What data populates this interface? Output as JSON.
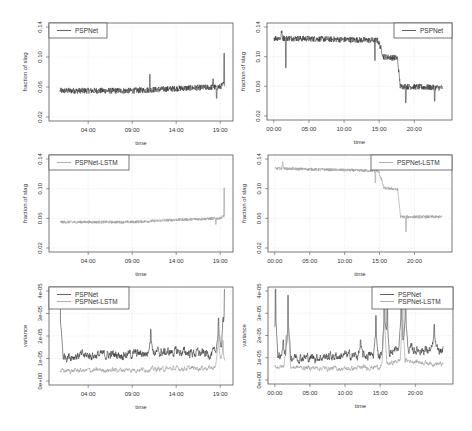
{
  "colors": {
    "pspnet": "#3a3a3a",
    "lstm": "#9a9a9a",
    "grid": "#d8d8d8",
    "frame": "#555555"
  },
  "chart_data": [
    {
      "type": "line",
      "id": "p1",
      "xlabel": "time",
      "ylabel": "fraction of slag",
      "ylim": [
        0.02,
        0.14
      ],
      "yticks": [
        "0.02",
        "0.06",
        "0.10",
        "0.14"
      ],
      "ytick_values": [
        0.02,
        0.06,
        0.1,
        0.14
      ],
      "xlim": [
        0,
        20
      ],
      "xticks": [
        "04:00",
        "09:00",
        "14:00",
        "19:00"
      ],
      "xtick_values": [
        4,
        9,
        14,
        19
      ],
      "legend": {
        "position": "top-left",
        "entries": [
          {
            "name": "PSPNet",
            "color": "pspnet"
          }
        ]
      },
      "series": [
        {
          "name": "PSPNet",
          "color": "pspnet",
          "x_range": [
            0.8,
            19.5
          ],
          "noise": 0.004,
          "levels": [
            [
              0.8,
              0.055
            ],
            [
              9,
              0.055
            ],
            [
              14,
              0.058
            ],
            [
              19,
              0.06
            ],
            [
              19.5,
              0.065
            ]
          ],
          "spikes": [
            [
              11,
              0.077
            ],
            [
              18.2,
              0.071
            ],
            [
              18.6,
              0.045
            ],
            [
              19.45,
              0.105
            ]
          ]
        }
      ]
    },
    {
      "type": "line",
      "id": "p2",
      "xlabel": "time",
      "ylabel": "fraction of slag",
      "ylim": [
        0.02,
        0.14
      ],
      "yticks": [
        "0.02",
        "0.06",
        "0.10",
        "0.14"
      ],
      "ytick_values": [
        0.02,
        0.06,
        0.1,
        0.14
      ],
      "xlim": [
        -0.4,
        24.8
      ],
      "xticks": [
        "00:00",
        "05:00",
        "10:00",
        "15:00",
        "20:00"
      ],
      "xtick_values": [
        0,
        5,
        10,
        15,
        20
      ],
      "legend": {
        "position": "top-right",
        "entries": [
          {
            "name": "PSPNet",
            "color": "pspnet"
          }
        ]
      },
      "series": [
        {
          "name": "PSPNet",
          "color": "pspnet",
          "x_range": [
            0,
            24
          ],
          "noise": 0.004,
          "levels": [
            [
              0,
              0.125
            ],
            [
              1,
              0.125
            ],
            [
              1.1,
              0.135
            ],
            [
              1.3,
              0.125
            ],
            [
              14.8,
              0.122
            ],
            [
              15.3,
              0.11
            ],
            [
              15.6,
              0.1
            ],
            [
              17.6,
              0.098
            ],
            [
              18.0,
              0.06
            ],
            [
              24,
              0.058
            ]
          ],
          "spikes": [
            [
              1.7,
              0.085
            ],
            [
              14.4,
              0.095
            ],
            [
              18.8,
              0.038
            ],
            [
              22.9,
              0.04
            ]
          ]
        }
      ]
    },
    {
      "type": "line",
      "id": "p3",
      "xlabel": "time",
      "ylabel": "fraction of slag",
      "ylim": [
        0.02,
        0.14
      ],
      "yticks": [
        "0.02",
        "0.06",
        "0.10",
        "0.14"
      ],
      "ytick_values": [
        0.02,
        0.06,
        0.1,
        0.14
      ],
      "xlim": [
        0,
        20
      ],
      "xticks": [
        "04:00",
        "09:00",
        "14:00",
        "19:00"
      ],
      "xtick_values": [
        4,
        9,
        14,
        19
      ],
      "legend": {
        "position": "top-left",
        "entries": [
          {
            "name": "PSPNet-LSTM",
            "color": "lstm"
          }
        ]
      },
      "series": [
        {
          "name": "PSPNet-LSTM",
          "color": "lstm",
          "x_range": [
            0.8,
            19.5
          ],
          "noise": 0.002,
          "levels": [
            [
              0.8,
              0.055
            ],
            [
              9,
              0.055
            ],
            [
              14,
              0.058
            ],
            [
              19,
              0.06
            ],
            [
              19.5,
              0.064
            ]
          ],
          "spikes": [
            [
              19.45,
              0.101
            ],
            [
              18.5,
              0.052
            ]
          ]
        }
      ]
    },
    {
      "type": "line",
      "id": "p4",
      "xlabel": "time",
      "ylabel": "fraction of slag",
      "ylim": [
        0.02,
        0.14
      ],
      "yticks": [
        "0.02",
        "0.06",
        "0.10",
        "0.14"
      ],
      "ytick_values": [
        0.02,
        0.06,
        0.1,
        0.14
      ],
      "xlim": [
        -0.4,
        24.8
      ],
      "xticks": [
        "00:00",
        "05:00",
        "10:00",
        "15:00",
        "20:00"
      ],
      "xtick_values": [
        0,
        5,
        10,
        15,
        20
      ],
      "legend": {
        "position": "top-right",
        "entries": [
          {
            "name": "PSPNet-LSTM",
            "color": "lstm"
          }
        ]
      },
      "series": [
        {
          "name": "PSPNet-LSTM",
          "color": "lstm",
          "x_range": [
            0,
            24
          ],
          "noise": 0.002,
          "levels": [
            [
              0,
              0.127
            ],
            [
              1,
              0.127
            ],
            [
              1.1,
              0.137
            ],
            [
              1.3,
              0.127
            ],
            [
              14.8,
              0.124
            ],
            [
              15.3,
              0.112
            ],
            [
              15.6,
              0.101
            ],
            [
              17.6,
              0.099
            ],
            [
              18.0,
              0.062
            ],
            [
              24,
              0.062
            ]
          ],
          "spikes": [
            [
              14.4,
              0.108
            ],
            [
              18.8,
              0.042
            ]
          ]
        }
      ]
    },
    {
      "type": "line",
      "id": "p5",
      "xlabel": "time",
      "ylabel": "variance",
      "ylim": [
        0,
        4e-05
      ],
      "yticks": [
        "0e+00",
        "1e-05",
        "2e-05",
        "3e-05",
        "4e-05"
      ],
      "ytick_values": [
        0,
        1e-05,
        2e-05,
        3e-05,
        4e-05
      ],
      "xlim": [
        0,
        20
      ],
      "xticks": [
        "04:00",
        "09:00",
        "14:00",
        "19:00"
      ],
      "xtick_values": [
        4,
        9,
        14,
        19
      ],
      "legend": {
        "position": "top-left",
        "entries": [
          {
            "name": "PSPNet",
            "color": "pspnet"
          },
          {
            "name": "PSPNet-LSTM",
            "color": "lstm"
          }
        ]
      },
      "series": [
        {
          "name": "PSPNet",
          "color": "pspnet",
          "x_range": [
            0.8,
            19.5
          ],
          "noise": 3e-06,
          "levels": [
            [
              0.8,
              1.1e-05
            ],
            [
              9,
              1.2e-05
            ],
            [
              14,
              1.3e-05
            ],
            [
              18,
              1.2e-05
            ],
            [
              19.5,
              1.3e-05
            ]
          ],
          "spikes": [
            [
              0.8,
              4.2e-05
            ],
            [
              11.1,
              2.3e-05
            ],
            [
              18.8,
              2.8e-05
            ],
            [
              19.3,
              2.2e-05
            ],
            [
              19.5,
              4.2e-05
            ]
          ]
        },
        {
          "name": "PSPNet-LSTM",
          "color": "lstm",
          "x_range": [
            0.8,
            19.5
          ],
          "noise": 1.5e-06,
          "levels": [
            [
              0.8,
              4.5e-06
            ],
            [
              9,
              5e-06
            ],
            [
              14,
              5.5e-06
            ],
            [
              19.5,
              6e-06
            ]
          ],
          "spikes": [
            [
              18.8,
              2.4e-05
            ],
            [
              19.3,
              1.8e-05
            ]
          ]
        }
      ]
    },
    {
      "type": "line",
      "id": "p6",
      "xlabel": "time",
      "ylabel": "variance",
      "ylim": [
        0,
        4e-05
      ],
      "yticks": [
        "0e+00",
        "1e-05",
        "2e-05",
        "3e-05",
        "4e-05"
      ],
      "ytick_values": [
        0,
        1e-05,
        2e-05,
        3e-05,
        4e-05
      ],
      "xlim": [
        -0.4,
        24.8
      ],
      "xticks": [
        "00:00",
        "05:00",
        "10:00",
        "15:00",
        "20:00"
      ],
      "xtick_values": [
        0,
        5,
        10,
        15,
        20
      ],
      "legend": {
        "position": "top-right",
        "entries": [
          {
            "name": "PSPNet",
            "color": "pspnet"
          },
          {
            "name": "PSPNet-LSTM",
            "color": "lstm"
          }
        ]
      },
      "series": [
        {
          "name": "PSPNet",
          "color": "pspnet",
          "x_range": [
            0,
            24
          ],
          "noise": 3e-06,
          "levels": [
            [
              0,
              1.1e-05
            ],
            [
              5,
              1e-05
            ],
            [
              10,
              1.1e-05
            ],
            [
              15,
              1.1e-05
            ],
            [
              18,
              1.4e-05
            ],
            [
              24,
              1.3e-05
            ]
          ],
          "spikes": [
            [
              0.1,
              4.2e-05
            ],
            [
              1.2,
              1.8e-05
            ],
            [
              1.9,
              3.8e-05
            ],
            [
              12.2,
              1.8e-05
            ],
            [
              14.4,
              2.9e-05
            ],
            [
              15.6,
              4.2e-05
            ],
            [
              16.0,
              3.5e-05
            ],
            [
              18.0,
              4.2e-05
            ],
            [
              18.6,
              4.2e-05
            ],
            [
              22.7,
              2.5e-05
            ]
          ]
        },
        {
          "name": "PSPNet-LSTM",
          "color": "lstm",
          "x_range": [
            0,
            24
          ],
          "noise": 1.5e-06,
          "levels": [
            [
              0,
              6e-06
            ],
            [
              10,
              5e-06
            ],
            [
              15,
              6e-06
            ],
            [
              18,
              9e-06
            ],
            [
              24,
              7e-06
            ]
          ],
          "spikes": [
            [
              1.9,
              3.8e-05
            ],
            [
              1.6,
              2e-05
            ],
            [
              15.6,
              4.2e-05
            ],
            [
              18.2,
              4.2e-05
            ]
          ]
        }
      ]
    }
  ]
}
